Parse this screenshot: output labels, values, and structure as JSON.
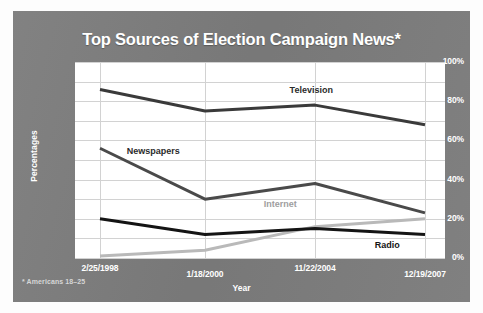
{
  "chart_data": {
    "type": "line",
    "title": "Top Sources of Election Campaign News*",
    "xlabel": "Year",
    "ylabel": "Percentages",
    "footnote": "* Americans 18–25",
    "categories": [
      "2/25/1998",
      "1/18/2000",
      "11/22/2004",
      "12/19/2007"
    ],
    "ylim": [
      0,
      100
    ],
    "yticks": [
      "0%",
      "20%",
      "40%",
      "60%",
      "80%",
      "100%"
    ],
    "ytick_values": [
      0,
      20,
      40,
      60,
      80,
      100
    ],
    "gridlines": [
      0,
      10,
      20,
      30,
      40,
      50,
      60,
      70,
      80,
      90,
      100
    ],
    "grid": true,
    "legend_position": "inline-labels",
    "series": [
      {
        "name": "Television",
        "values": [
          86,
          75,
          78,
          68
        ],
        "color": "#3a3a3a",
        "label_color": "#2b2b2b",
        "label_x_pct": 58,
        "label_y_value": 85
      },
      {
        "name": "Newspapers",
        "values": [
          56,
          30,
          38,
          23
        ],
        "color": "#4a4a4a",
        "label_color": "#2b2b2b",
        "label_x_pct": 14,
        "label_y_value": 54
      },
      {
        "name": "Internet",
        "values": [
          1,
          4,
          16,
          20
        ],
        "color": "#b9b9b9",
        "label_color": "#9e9e9e",
        "label_x_pct": 51,
        "label_y_value": 27
      },
      {
        "name": "Radio",
        "values": [
          20,
          12,
          15,
          12
        ],
        "color": "#141414",
        "label_color": "#141414",
        "label_x_pct": 81,
        "label_y_value": 6
      }
    ]
  },
  "figure": {
    "background_color": "#7c7c7c",
    "plot_background_color": "#ffffff",
    "text_color": "#ffffff",
    "grid_color": "#d2d2d2"
  }
}
